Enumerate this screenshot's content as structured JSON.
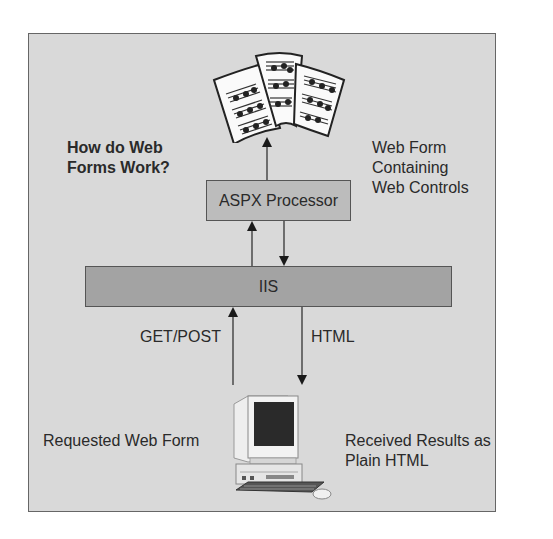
{
  "diagram": {
    "title_line1": "How do Web",
    "title_line2": "Forms Work?",
    "web_form_label": {
      "line1": "Web Form",
      "line2": "Containing",
      "line3": "Web Controls"
    },
    "aspx_box": "ASPX Processor",
    "iis_box": "IIS",
    "get_post_label": "GET/POST",
    "html_label": "HTML",
    "requested_label": "Requested Web Form",
    "received_label": {
      "line1": "Received Results as",
      "line2": "Plain HTML"
    },
    "icons": {
      "top": "sheet-music-pages-icon",
      "bottom": "desktop-computer-icon"
    },
    "colors": {
      "frame_bg": "#d9d9d9",
      "aspx_bg": "#bcbcbc",
      "iis_bg": "#a3a3a3",
      "border": "#555555"
    }
  }
}
